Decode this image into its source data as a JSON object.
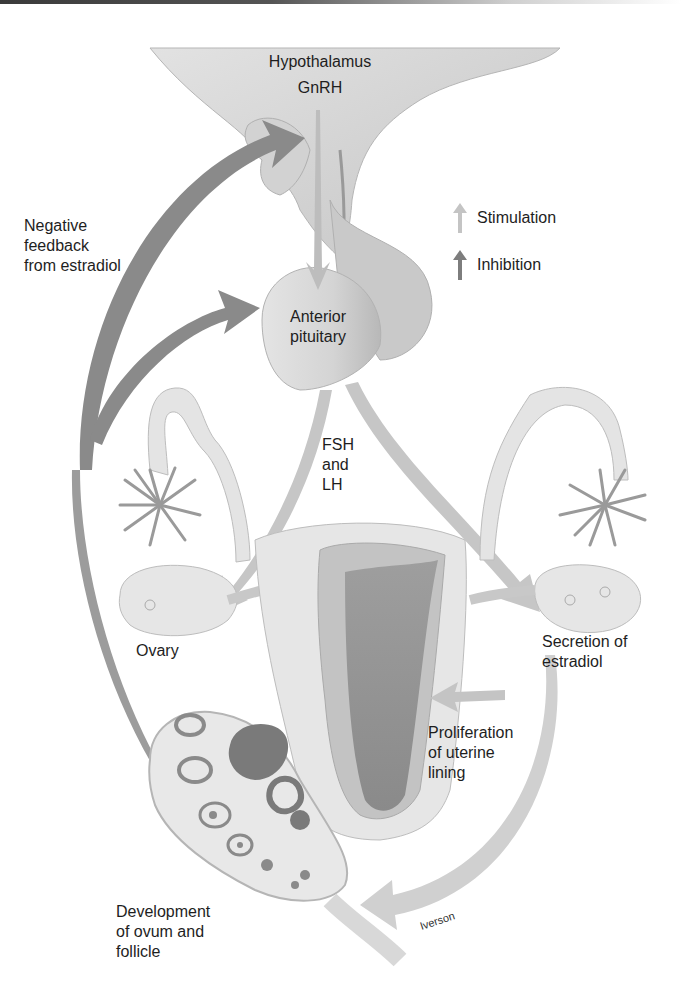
{
  "diagram": {
    "type": "hormonal feedback loop",
    "structures": {
      "hypothalamus": "Hypothalamus",
      "hypothalamus_hormone": "GnRH",
      "pituitary": "Anterior\npituitary",
      "pituitary_hormones": "FSH\nand\nLH",
      "ovary": "Ovary",
      "ovary_output": "Secretion of\nestradiol",
      "uterus_effect": "Proliferation\nof uterine\nlining",
      "follicle": "Development\nof ovum and\nfollicle",
      "feedback": "Negative\nfeedback\nfrom estradiol"
    },
    "legend": [
      {
        "label": "Stimulation",
        "icon": "light-arrow-up-icon",
        "color": "#c4c4c4"
      },
      {
        "label": "Inhibition",
        "icon": "dark-arrow-up-icon",
        "color": "#7d7d7d"
      }
    ],
    "signature": "Iverson",
    "colors": {
      "tissue_light": "#e6e6e6",
      "tissue_mid": "#cfcfcf",
      "tissue_dark": "#a8a8a8",
      "stimulation_arrow": "#c8c8c8",
      "inhibition_arrow": "#808080",
      "follicle_dark": "#7a7a7a"
    }
  }
}
